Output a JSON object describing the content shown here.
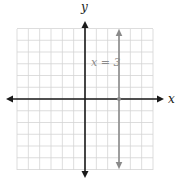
{
  "chart_data": {
    "type": "line",
    "title": "",
    "xlabel": "x",
    "ylabel": "y",
    "xlim": [
      -6,
      6
    ],
    "ylim": [
      -6,
      6
    ],
    "grid": true,
    "grid_step": 1,
    "series": [
      {
        "name": "x = 3",
        "kind": "vertical-line",
        "x": [
          3,
          3
        ],
        "y": [
          -6,
          6
        ],
        "color": "#8a8a8a",
        "marker_point": [
          3,
          0
        ]
      }
    ],
    "annotations": [
      {
        "text": "x = 3",
        "x": 0.5,
        "y": 3
      }
    ]
  },
  "labels": {
    "x_axis": "x",
    "y_axis": "y",
    "equation": "x = 3"
  },
  "colors": {
    "axis": "#1a1a1a",
    "grid": "#d4d4d4",
    "line": "#8a8a8a"
  }
}
